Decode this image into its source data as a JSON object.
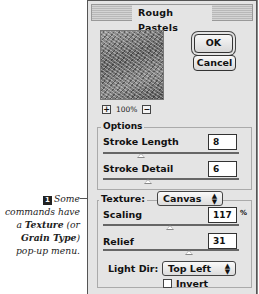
{
  "caption": {
    "step_number": "1",
    "text_before": "Some commands have a ",
    "bold_1": "Texture",
    "text_middle": " (or ",
    "bold_2": "Grain Type",
    "text_after": ") pop-up menu."
  },
  "dialog": {
    "title": "Rough Pastels",
    "ok_label": "OK",
    "cancel_label": "Cancel",
    "preview": {
      "zoom_in": "+",
      "zoom_level": "100%",
      "zoom_out": "−"
    },
    "options": {
      "group_label": "Options",
      "stroke_length": {
        "label": "Stroke Length",
        "value": "8"
      },
      "stroke_detail": {
        "label": "Stroke Detail",
        "value": "6"
      }
    },
    "texture": {
      "label": "Texture:",
      "selected": "Canvas",
      "scaling": {
        "label": "Scaling",
        "value": "117",
        "unit": "%"
      },
      "relief": {
        "label": "Relief",
        "value": "31"
      },
      "light_dir": {
        "label": "Light Dir:",
        "selected": "Top Left"
      },
      "invert": {
        "label": "Invert",
        "checked": false
      }
    }
  }
}
